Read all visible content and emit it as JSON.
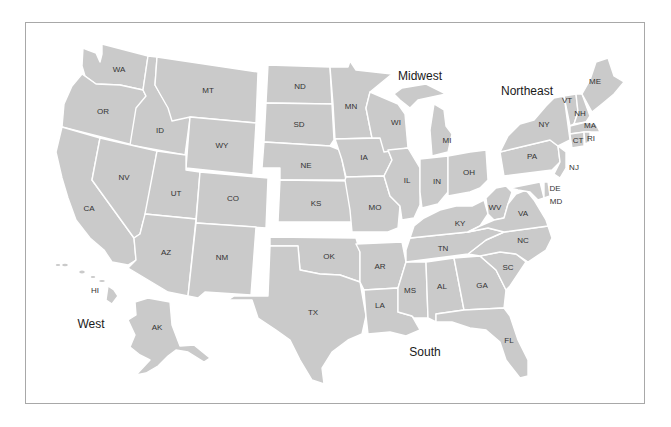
{
  "map": {
    "fill_color": "#cacaca",
    "border_color": "#ffffff",
    "frame_color": "#a8a8a8",
    "regions": {
      "west": "West",
      "midwest": "Midwest",
      "northeast": "Northeast",
      "south": "South"
    },
    "states": {
      "WA": "WA",
      "OR": "OR",
      "CA": "CA",
      "ID": "ID",
      "NV": "NV",
      "MT": "MT",
      "WY": "WY",
      "UT": "UT",
      "CO": "CO",
      "AZ": "AZ",
      "NM": "NM",
      "AK": "AK",
      "HI": "HI",
      "ND": "ND",
      "SD": "SD",
      "NE": "NE",
      "KS": "KS",
      "MN": "MN",
      "IA": "IA",
      "MO": "MO",
      "WI": "WI",
      "IL": "IL",
      "MI": "MI",
      "IN": "IN",
      "OH": "OH",
      "NY": "NY",
      "PA": "PA",
      "NJ": "NJ",
      "VT": "VT",
      "NH": "NH",
      "ME": "ME",
      "MA": "MA",
      "CT": "CT",
      "RI": "RI",
      "DE": "DE",
      "MD": "MD",
      "WV": "WV",
      "VA": "VA",
      "KY": "KY",
      "TN": "TN",
      "NC": "NC",
      "SC": "SC",
      "GA": "GA",
      "AL": "AL",
      "MS": "MS",
      "AR": "AR",
      "LA": "LA",
      "OK": "OK",
      "TX": "TX",
      "FL": "FL"
    }
  }
}
